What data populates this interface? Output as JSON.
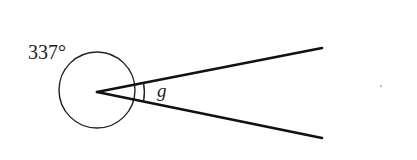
{
  "diagram": {
    "type": "angle-diagram",
    "reflex_angle_label": "337°",
    "unknown_angle_label": "g",
    "vertex": {
      "x": 97,
      "y": 92
    },
    "reflex_arc": {
      "cx": 97,
      "cy": 90,
      "r": 38
    },
    "rays": [
      {
        "name": "upper-ray",
        "x2": 322,
        "y2": 48
      },
      {
        "name": "lower-ray",
        "x2": 322,
        "y2": 138
      }
    ],
    "colors": {
      "stroke": "#111111",
      "text": "#222222",
      "background": "#ffffff"
    }
  }
}
